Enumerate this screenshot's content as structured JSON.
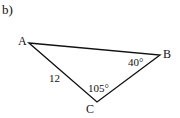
{
  "figure": {
    "part_label": "b)",
    "vertices": [
      {
        "name": "A",
        "label": "A",
        "x": 29,
        "y": 43
      },
      {
        "name": "B",
        "label": "B",
        "x": 160,
        "y": 55
      },
      {
        "name": "C",
        "label": "C",
        "x": 97,
        "y": 102
      }
    ],
    "sides": {
      "AC": "12"
    },
    "angles": {
      "B": "40°",
      "C": "105°"
    },
    "stroke_color": "#111111"
  }
}
